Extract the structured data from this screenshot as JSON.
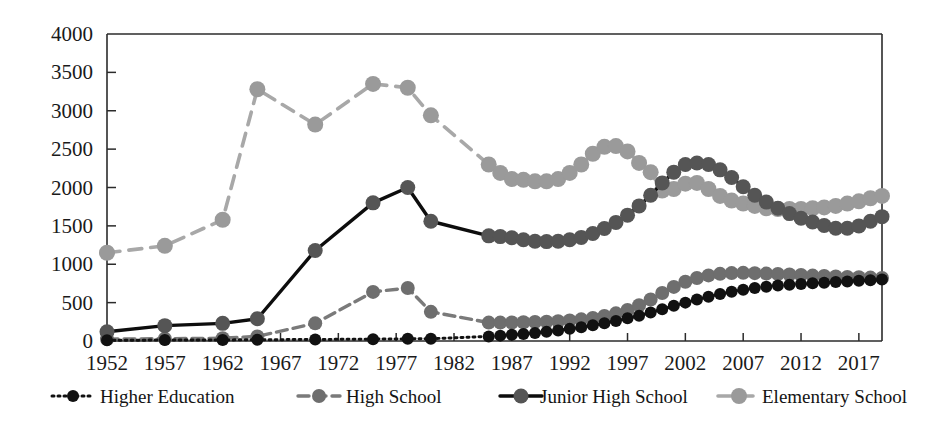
{
  "chart_data": {
    "type": "line",
    "title": "",
    "subtitle": "",
    "xlabel": "",
    "ylabel": "",
    "xlim": [
      1952,
      2019
    ],
    "ylim": [
      0,
      4000
    ],
    "ytick_step": 500,
    "grid": false,
    "legend_position": "bottom",
    "xticks": [
      "1952",
      "1957",
      "1962",
      "1967",
      "1972",
      "1977",
      "1982",
      "1987",
      "1992",
      "1997",
      "2002",
      "2007",
      "2012",
      "2017"
    ],
    "xtick_values": [
      1952,
      1957,
      1962,
      1967,
      1972,
      1977,
      1982,
      1987,
      1992,
      1997,
      2002,
      2007,
      2012,
      2017
    ],
    "yticks": [
      "0",
      "500",
      "1000",
      "1500",
      "2000",
      "2500",
      "3000",
      "3500",
      "4000"
    ],
    "ytick_values": [
      0,
      500,
      1000,
      1500,
      2000,
      2500,
      3000,
      3500,
      4000
    ],
    "series": [
      {
        "name": "Higher Education",
        "color": "#111111",
        "marker_color": "#111111",
        "dash": "2,4",
        "width": 3,
        "marker_radius": 6,
        "x": [
          1952,
          1957,
          1962,
          1965,
          1970,
          1975,
          1978,
          1980,
          1985,
          1986,
          1987,
          1988,
          1989,
          1990,
          1991,
          1992,
          1993,
          1994,
          1995,
          1996,
          1997,
          1998,
          1999,
          2000,
          2001,
          2002,
          2003,
          2004,
          2005,
          2006,
          2007,
          2008,
          2009,
          2010,
          2011,
          2012,
          2013,
          2014,
          2015,
          2016,
          2017,
          2018,
          2019
        ],
        "y": [
          10,
          12,
          14,
          16,
          20,
          24,
          28,
          30,
          60,
          70,
          80,
          92,
          105,
          120,
          138,
          158,
          180,
          205,
          232,
          262,
          295,
          330,
          372,
          415,
          458,
          500,
          540,
          578,
          612,
          642,
          668,
          690,
          708,
          722,
          734,
          744,
          752,
          760,
          768,
          776,
          784,
          792,
          800
        ]
      },
      {
        "name": "High School",
        "color": "#7a7a7a",
        "marker_color": "#6e6e6e",
        "dash": "11,6",
        "width": 3.4,
        "marker_radius": 7,
        "x": [
          1952,
          1957,
          1962,
          1965,
          1970,
          1975,
          1978,
          1980,
          1985,
          1986,
          1987,
          1988,
          1989,
          1990,
          1991,
          1992,
          1993,
          1994,
          1995,
          1996,
          1997,
          1998,
          1999,
          2000,
          2001,
          2002,
          2003,
          2004,
          2005,
          2006,
          2007,
          2008,
          2009,
          2010,
          2011,
          2012,
          2013,
          2014,
          2015,
          2016,
          2017,
          2018,
          2019
        ],
        "y": [
          25,
          30,
          36,
          60,
          230,
          640,
          690,
          380,
          240,
          240,
          242,
          245,
          248,
          252,
          258,
          268,
          282,
          300,
          325,
          360,
          405,
          465,
          540,
          625,
          705,
          772,
          820,
          855,
          875,
          885,
          888,
          884,
          878,
          872,
          866,
          860,
          852,
          846,
          840,
          834,
          830,
          826,
          822
        ]
      },
      {
        "name": "Junior High School",
        "color": "#0d0d0d",
        "marker_color": "#555555",
        "dash": "",
        "width": 3.4,
        "marker_radius": 7.5,
        "x": [
          1952,
          1957,
          1962,
          1965,
          1970,
          1975,
          1978,
          1980,
          1985,
          1986,
          1987,
          1988,
          1989,
          1990,
          1991,
          1992,
          1993,
          1994,
          1995,
          1996,
          1997,
          1998,
          1999,
          2000,
          2001,
          2002,
          2003,
          2004,
          2005,
          2006,
          2007,
          2008,
          2009,
          2010,
          2011,
          2012,
          2013,
          2014,
          2015,
          2016,
          2017,
          2018,
          2019
        ],
        "y": [
          120,
          200,
          230,
          290,
          1180,
          1800,
          2000,
          1560,
          1370,
          1360,
          1345,
          1320,
          1300,
          1295,
          1300,
          1320,
          1350,
          1400,
          1465,
          1545,
          1640,
          1760,
          1900,
          2060,
          2200,
          2300,
          2320,
          2300,
          2230,
          2130,
          2010,
          1900,
          1810,
          1730,
          1660,
          1600,
          1550,
          1505,
          1470,
          1470,
          1500,
          1560,
          1620
        ]
      },
      {
        "name": "Elementary School",
        "color": "#a8a8a8",
        "marker_color": "#9a9a9a",
        "dash": "13,9",
        "width": 3.6,
        "marker_radius": 8,
        "x": [
          1952,
          1957,
          1962,
          1965,
          1970,
          1975,
          1978,
          1980,
          1985,
          1986,
          1987,
          1988,
          1989,
          1990,
          1991,
          1992,
          1993,
          1994,
          1995,
          1996,
          1997,
          1998,
          1999,
          2000,
          2001,
          2002,
          2003,
          2004,
          2005,
          2006,
          2007,
          2008,
          2009,
          2010,
          2011,
          2012,
          2013,
          2014,
          2015,
          2016,
          2017,
          2018,
          2019
        ],
        "y": [
          1150,
          1240,
          1580,
          3280,
          2820,
          3350,
          3300,
          2940,
          2300,
          2190,
          2110,
          2100,
          2080,
          2080,
          2110,
          2190,
          2300,
          2440,
          2530,
          2540,
          2470,
          2320,
          2200,
          1960,
          1980,
          2050,
          2060,
          1980,
          1890,
          1830,
          1790,
          1760,
          1730,
          1720,
          1720,
          1720,
          1730,
          1740,
          1760,
          1790,
          1820,
          1860,
          1890
        ]
      }
    ]
  },
  "legend": {
    "items": [
      {
        "label": "Higher Education",
        "icon": "dotted-line-marker-icon"
      },
      {
        "label": "High School",
        "icon": "dashed-line-marker-icon"
      },
      {
        "label": "Junior High School",
        "icon": "solid-line-marker-icon"
      },
      {
        "label": "Elementary School",
        "icon": "wide-dashed-line-marker-icon"
      }
    ]
  }
}
